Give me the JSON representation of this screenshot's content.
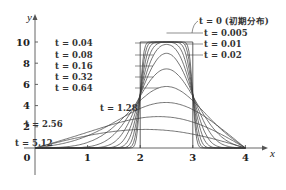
{
  "chart_data": {
    "type": "line",
    "title": "",
    "xlabel": "x",
    "ylabel": "y",
    "xlim": [
      0,
      4
    ],
    "ylim": [
      0,
      11
    ],
    "x_ticks": [
      "0",
      "1",
      "2",
      "3",
      "4"
    ],
    "x_tick_values": [
      0,
      1,
      2,
      3,
      4
    ],
    "y_ticks": [
      "2",
      "4",
      "6",
      "8",
      "10"
    ],
    "y_tick_values": [
      2,
      4,
      6,
      8,
      10
    ],
    "grid": false,
    "initial_distribution": {
      "label": "t = 0 (初期分布)",
      "shape": "box",
      "x_from": 2,
      "x_to": 3,
      "height": 10
    },
    "model": {
      "description": "Heat equation solution, zero boundary values at x=0 and x=4",
      "diffusivity": 0.3,
      "domain": [
        0,
        4
      ]
    },
    "series": [
      {
        "name": "t=0.005",
        "t": 0.005,
        "label": "t = 0.005",
        "label_side": "right"
      },
      {
        "name": "t=0.01",
        "t": 0.01,
        "label": "t = 0.01",
        "label_side": "right"
      },
      {
        "name": "t=0.02",
        "t": 0.02,
        "label": "t = 0.02",
        "label_side": "right"
      },
      {
        "name": "t=0.04",
        "t": 0.04,
        "label": "t = 0.04",
        "label_side": "left"
      },
      {
        "name": "t=0.08",
        "t": 0.08,
        "label": "t = 0.08",
        "label_side": "left"
      },
      {
        "name": "t=0.16",
        "t": 0.16,
        "label": "t = 0.16",
        "label_side": "left"
      },
      {
        "name": "t=0.32",
        "t": 0.32,
        "label": "t = 0.32",
        "label_side": "left"
      },
      {
        "name": "t=0.64",
        "t": 0.64,
        "label": "t = 0.64",
        "label_side": "left"
      },
      {
        "name": "t=1.28",
        "t": 1.28,
        "label": "t = 1.28",
        "label_side": "left"
      },
      {
        "name": "t=2.56",
        "t": 2.56,
        "label": "t = 2.56",
        "label_side": "left"
      },
      {
        "name": "t=5.12",
        "t": 5.12,
        "label": "t = 5.12",
        "label_side": "left"
      }
    ],
    "legend": "inline-annotations"
  }
}
